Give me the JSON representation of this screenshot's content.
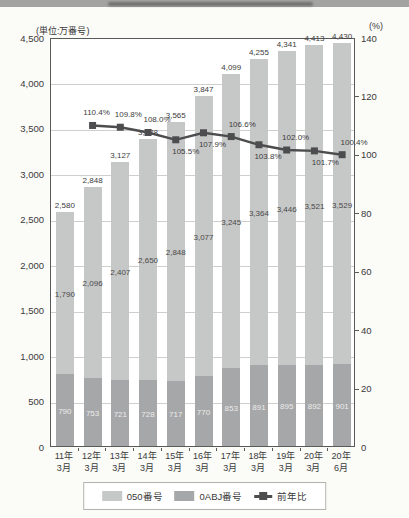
{
  "colors": {
    "bar_light": "#c6c7c7",
    "bar_dark": "#a6a7a8",
    "line": "#4d4d4f",
    "grid": "#cfcfcc",
    "axis": "#5a5a5a",
    "strip": "#a3a3a1"
  },
  "chart": {
    "unit_left": "(単位:万番号)",
    "unit_right": "(%)"
  },
  "legend": {
    "items": [
      {
        "label": "050番号",
        "swatch": "light-bar"
      },
      {
        "label": "0ABJ番号",
        "swatch": "dark-bar"
      },
      {
        "label": "前年比",
        "swatch": "line-marker"
      }
    ]
  },
  "chart_data": {
    "type": "bar",
    "subtype": "stacked-bar-with-line",
    "title": "",
    "unit_left": "(単位:万番号)",
    "unit_right": "(%)",
    "categories": [
      [
        "11年",
        "3月"
      ],
      [
        "12年",
        "3月"
      ],
      [
        "13年",
        "3月"
      ],
      [
        "14年",
        "3月"
      ],
      [
        "15年",
        "3月"
      ],
      [
        "16年",
        "3月"
      ],
      [
        "17年",
        "3月"
      ],
      [
        "18年",
        "3月"
      ],
      [
        "19年",
        "3月"
      ],
      [
        "20年",
        "3月"
      ],
      [
        "20年",
        "6月"
      ]
    ],
    "left_axis": {
      "min": 0,
      "max": 4500,
      "step": 500,
      "tick_labels": [
        "0",
        "500",
        "1,000",
        "1,500",
        "2,000",
        "2,500",
        "3,000",
        "3,500",
        "4,000",
        "4,500"
      ]
    },
    "right_axis": {
      "min": 0,
      "max": 140,
      "step": 20,
      "tick_labels": [
        "0",
        "20",
        "40",
        "60",
        "80",
        "100",
        "120",
        "140"
      ]
    },
    "grid": true,
    "legend_position": "bottom",
    "totals": [
      2580,
      2848,
      3127,
      3378,
      3565,
      3847,
      4099,
      4255,
      4341,
      4413,
      4430
    ],
    "series": [
      {
        "name": "050番号",
        "role": "bar-upper-segment",
        "color": "#c6c7c7",
        "values": [
          1790,
          2096,
          2407,
          2650,
          2848,
          3077,
          3245,
          3364,
          3446,
          3521,
          3529
        ]
      },
      {
        "name": "0ABJ番号",
        "role": "bar-lower-segment",
        "color": "#a6a7a8",
        "values": [
          790,
          753,
          721,
          728,
          717,
          770,
          853,
          891,
          895,
          892,
          901
        ]
      },
      {
        "name": "前年比",
        "role": "line",
        "axis": "right",
        "color": "#4d4d4f",
        "values": [
          null,
          110.4,
          109.8,
          108.0,
          105.5,
          107.9,
          106.6,
          103.8,
          102.0,
          101.7,
          100.4
        ],
        "label_side": [
          "",
          "above",
          "above",
          "above",
          "below",
          "below",
          "above",
          "below",
          "above",
          "below",
          "above"
        ],
        "label_dx": [
          0,
          4,
          8,
          9,
          10,
          9,
          11,
          9,
          9,
          11,
          12
        ]
      }
    ]
  }
}
